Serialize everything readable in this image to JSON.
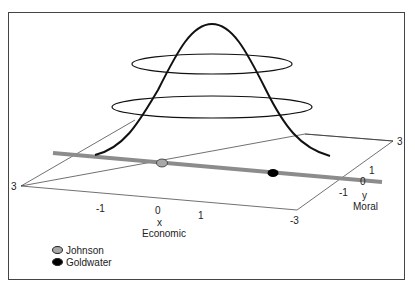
{
  "figure": {
    "axes": {
      "x": {
        "letter": "x",
        "name": "Economic",
        "ticks": [
          "-1",
          "0",
          "1",
          "-3"
        ],
        "corner_left": "3"
      },
      "y": {
        "letter": "y",
        "name": "Moral",
        "ticks": [
          "3",
          "1",
          "0",
          "-1"
        ]
      }
    },
    "legend": [
      {
        "label": "Johnson",
        "color": "#a8a8a8"
      },
      {
        "label": "Goldwater",
        "color": "#000000"
      }
    ],
    "colors": {
      "line": "#8c8c8c",
      "curve": "#111111",
      "plane": "#333333",
      "frame": "#444444"
    }
  }
}
